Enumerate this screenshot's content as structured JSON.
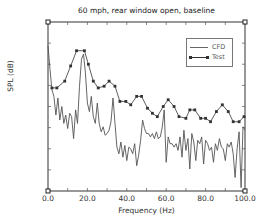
{
  "chart_data": {
    "type": "line",
    "title": "60 mph, rear window open, baseline",
    "xlabel": "Frequency (Hz)",
    "ylabel": "SPL (dB)",
    "xlim": [
      0,
      100
    ],
    "ylim_normalized": [
      0,
      100
    ],
    "y_note": "No numeric y tick labels shown; y values normalized 0 (bottom) to 100 (top of axes)",
    "x_ticks": [
      "0.0",
      "20.0",
      "40.0",
      "60.0",
      "80.0",
      "100.0"
    ],
    "grid": false,
    "legend_position": "upper right",
    "series": [
      {
        "name": "CFD",
        "style": "solid line, no markers",
        "color": "#555555",
        "x": [
          0,
          1,
          2,
          3,
          4,
          5,
          6,
          7,
          8,
          9,
          10,
          11,
          12,
          13,
          14,
          15,
          16,
          17,
          18,
          19,
          20,
          21,
          22,
          23,
          24,
          25,
          26,
          27,
          28,
          29,
          30,
          31,
          32,
          33,
          34,
          35,
          36,
          37,
          38,
          39,
          40,
          41,
          42,
          43,
          44,
          45,
          46,
          47,
          48,
          49,
          50,
          51,
          52,
          53,
          54,
          55,
          56,
          57,
          58,
          59,
          60,
          61,
          62,
          63,
          64,
          65,
          66,
          67,
          68,
          69,
          70,
          71,
          72,
          73,
          74,
          75,
          76,
          77,
          78,
          79,
          80,
          81,
          82,
          83,
          84,
          85,
          86,
          87,
          88,
          89,
          90,
          91,
          92,
          93,
          94,
          95,
          96,
          97,
          98,
          99,
          100
        ],
        "y": [
          86,
          72,
          60,
          56,
          45,
          55,
          42,
          50,
          40,
          45,
          37,
          46,
          44,
          31,
          48,
          40,
          62,
          78,
          81,
          70,
          52,
          47,
          56,
          44,
          40,
          52,
          40,
          35,
          38,
          33,
          34,
          36,
          41,
          55,
          40,
          26,
          22,
          29,
          20,
          27,
          18,
          26,
          25,
          22,
          28,
          15,
          21,
          30,
          42,
          37,
          34,
          34,
          32,
          34,
          31,
          35,
          31,
          32,
          38,
          48,
          17,
          32,
          28,
          28,
          26,
          28,
          24,
          32,
          20,
          36,
          24,
          31,
          13,
          34,
          29,
          18,
          30,
          28,
          32,
          16,
          30,
          28,
          24,
          26,
          17,
          28,
          24,
          31,
          26,
          25,
          18,
          28,
          26,
          29,
          22,
          8,
          25,
          35,
          2,
          38,
          36
        ]
      },
      {
        "name": "Test",
        "style": "solid line with square markers",
        "color": "#333333",
        "x": [
          2,
          4.5,
          8.5,
          11.5,
          14.5,
          18.5,
          20.5,
          23,
          25.5,
          28.5,
          31,
          34,
          36.5,
          39.5,
          42,
          45,
          47.5,
          50.5,
          53,
          55.5,
          58.5,
          61,
          64,
          66.5,
          70,
          72,
          74.5,
          77.5,
          80,
          82.5,
          85.5,
          88.5,
          91.5,
          94,
          97,
          99.5
        ],
        "y": [
          61,
          61,
          65,
          74,
          83,
          83,
          75,
          65,
          61,
          62,
          65,
          62,
          53,
          53,
          51,
          56,
          56,
          49,
          46,
          44,
          50,
          54,
          50,
          44,
          43,
          48,
          48,
          43,
          43,
          41,
          47,
          51,
          47,
          41,
          41,
          44
        ]
      }
    ]
  },
  "title": "60 mph, rear window open, baseline",
  "xlabel": "Frequency (Hz)",
  "ylabel": "SPL (dB)",
  "x_ticks": [
    "0.0",
    "20.0",
    "40.0",
    "60.0",
    "80.0",
    "100.0"
  ],
  "legend": {
    "items": [
      {
        "label": "CFD"
      },
      {
        "label": "Test"
      }
    ]
  }
}
